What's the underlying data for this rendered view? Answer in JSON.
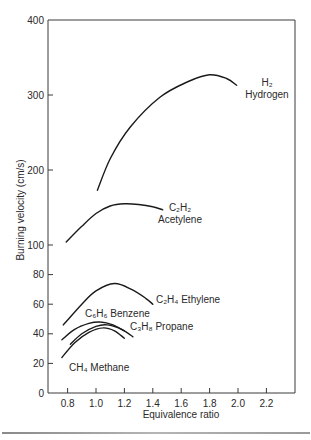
{
  "chart_data": {
    "type": "line",
    "title": "",
    "xlabel": "Equivalence ratio",
    "ylabel": "Burning velocity (cm/s)",
    "xlim": [
      0.7,
      2.4
    ],
    "ylim": [
      0,
      400
    ],
    "y_scale_note": "piecewise: 0-100 expanded, 100-400 compressed",
    "x_ticks": [
      0.8,
      1.0,
      1.2,
      1.4,
      1.6,
      1.8,
      2.0,
      2.2
    ],
    "x_tick_labels": [
      "0.8",
      "1.0",
      "1.2",
      "1.4",
      "1.6",
      "1.8",
      "2.0",
      "2.2"
    ],
    "y_ticks": [
      0,
      20,
      40,
      60,
      80,
      100,
      200,
      300,
      400
    ],
    "y_tick_labels": [
      "0",
      "20",
      "40",
      "60",
      "80",
      "100",
      "200",
      "300",
      "400"
    ],
    "grid": false,
    "legend": "inline labels",
    "series": [
      {
        "name": "H2 Hydrogen",
        "formula": "H2",
        "label_line1": "H₂",
        "label_line2": "Hydrogen",
        "x": [
          1.01,
          1.1,
          1.24,
          1.45,
          1.65,
          1.8,
          1.92,
          1.99
        ],
        "y": [
          173,
          215,
          257,
          297,
          318,
          327,
          322,
          313
        ]
      },
      {
        "name": "C2H2 Acetylene",
        "formula": "C2H2",
        "label_line1": "C₂H₂",
        "label_line2": "Acetylene",
        "x": [
          0.79,
          0.9,
          1.0,
          1.1,
          1.2,
          1.3,
          1.4,
          1.47
        ],
        "y": [
          104,
          125,
          142,
          152,
          155,
          154,
          151,
          147
        ]
      },
      {
        "name": "C2H4 Ethylene",
        "formula": "C2H4",
        "label": "C₂H₄ Ethylene",
        "x": [
          0.77,
          0.9,
          1.0,
          1.13,
          1.25,
          1.35,
          1.4
        ],
        "y": [
          46,
          60,
          69,
          74,
          70,
          64,
          60
        ]
      },
      {
        "name": "C6H6 Benzene",
        "formula": "C6H6",
        "label": "C₆H₆ Benzene",
        "x": [
          0.76,
          0.85,
          0.95,
          1.03,
          1.12,
          1.2
        ],
        "y": [
          36,
          43,
          47,
          48,
          46,
          42
        ]
      },
      {
        "name": "C3H8 Propane",
        "formula": "C3H8",
        "label": "C₃H₈ Propane",
        "x": [
          0.82,
          0.9,
          1.0,
          1.08,
          1.18,
          1.26
        ],
        "y": [
          33,
          40,
          45,
          46,
          43,
          38
        ]
      },
      {
        "name": "CH4 Methane",
        "formula": "CH4",
        "label": "CH₄ Methane",
        "x": [
          0.76,
          0.85,
          0.95,
          1.05,
          1.13,
          1.2
        ],
        "y": [
          24,
          34,
          41,
          44,
          42,
          37
        ]
      }
    ]
  },
  "labels": {
    "xlabel": "Equivalence ratio",
    "ylabel": "Burning velocity (cm/s)"
  },
  "colors": {
    "curve": "#1a1a1a",
    "frame": "#3a3a3a",
    "text": "#2a2a2a"
  }
}
